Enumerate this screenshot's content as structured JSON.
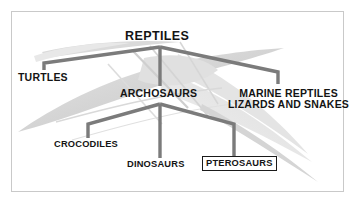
{
  "figure": {
    "kind": "cladogram",
    "title_node": "REPTILES",
    "frame_color": "#c9c9c9",
    "connector_color": "#7b7b7b",
    "text_color": "#141414",
    "background_color": "#ffffff",
    "watermark_color": "#d8d8d8",
    "watermark_subject": "pterosaur-skeleton-wing"
  },
  "nodes": {
    "reptiles": {
      "label": "REPTILES",
      "level": 1
    },
    "turtles": {
      "label": "TURTLES",
      "level": 2
    },
    "archosaurs": {
      "label": "ARCHOSAURS",
      "level": 2
    },
    "marine_reptiles": {
      "label": "MARINE REPTILES",
      "level": 2
    },
    "lizards_and_snakes": {
      "label": "LIZARDS AND SNAKES",
      "level": 2
    },
    "crocodiles": {
      "label": "CROCODILES",
      "level": 3
    },
    "dinosaurs": {
      "label": "DINOSAURS",
      "level": 3
    },
    "pterosaurs": {
      "label": "PTEROSAURS",
      "level": 3,
      "highlighted": true
    }
  },
  "edges": [
    {
      "from": "reptiles",
      "to": "turtles"
    },
    {
      "from": "reptiles",
      "to": "archosaurs"
    },
    {
      "from": "reptiles",
      "to": "marine_reptiles"
    },
    {
      "from": "archosaurs",
      "to": "crocodiles"
    },
    {
      "from": "archosaurs",
      "to": "dinosaurs"
    },
    {
      "from": "archosaurs",
      "to": "pterosaurs"
    }
  ]
}
